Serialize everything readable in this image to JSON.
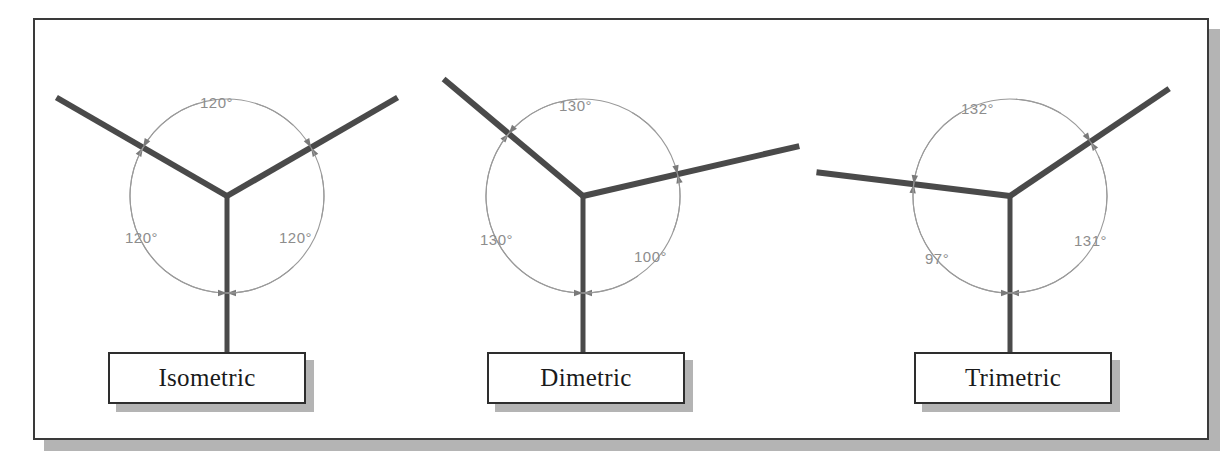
{
  "figure": {
    "frame": {
      "border_color": "#3a3a3a",
      "shadow_color": "#b4b4b4",
      "background": "#ffffff"
    },
    "style": {
      "axis_color": "#4a4a4a",
      "arc_color": "#9a9a9a",
      "arrow_color": "#7a7a7a",
      "label_text_color": "#1a1a1a",
      "angle_text_color": "#8d8d8d"
    }
  },
  "diagrams": [
    {
      "id": "isometric",
      "label": "Isometric",
      "origin": {
        "x": 227,
        "y": 196
      },
      "arc_radius": 97,
      "axes": [
        {
          "name": "left-axis",
          "angle_deg": 150,
          "length": 197
        },
        {
          "name": "right-axis",
          "angle_deg": 30,
          "length": 197
        },
        {
          "name": "vertical-axis",
          "angle_deg": 270,
          "length": 156
        }
      ],
      "angles": [
        {
          "name": "top-angle",
          "value": "120°",
          "x": 200,
          "y": 94,
          "between": "left-axis/right-axis"
        },
        {
          "name": "left-angle",
          "value": "120°",
          "x": 125,
          "y": 229,
          "between": "left-axis/vertical-axis"
        },
        {
          "name": "right-angle",
          "value": "120°",
          "x": 279,
          "y": 229,
          "between": "right-axis/vertical-axis"
        }
      ],
      "box": {
        "x": 108,
        "y": 352,
        "w": 198,
        "h": 52
      }
    },
    {
      "id": "dimetric",
      "label": "Dimetric",
      "origin": {
        "x": 583,
        "y": 196
      },
      "arc_radius": 97,
      "axes": [
        {
          "name": "left-axis",
          "angle_deg": 140,
          "length": 182
        },
        {
          "name": "right-axis",
          "angle_deg": 13,
          "length": 222
        },
        {
          "name": "vertical-axis",
          "angle_deg": 270,
          "length": 156
        }
      ],
      "angles": [
        {
          "name": "top-angle",
          "value": "130°",
          "x": 559,
          "y": 97,
          "between": "left-axis/right-axis"
        },
        {
          "name": "left-angle",
          "value": "130°",
          "x": 480,
          "y": 231,
          "between": "left-axis/vertical-axis"
        },
        {
          "name": "right-angle",
          "value": "100°",
          "x": 634,
          "y": 248,
          "between": "right-axis/vertical-axis"
        }
      ],
      "box": {
        "x": 487,
        "y": 352,
        "w": 198,
        "h": 52
      }
    },
    {
      "id": "trimetric",
      "label": "Trimetric",
      "origin": {
        "x": 1010,
        "y": 196
      },
      "arc_radius": 97,
      "axes": [
        {
          "name": "left-axis",
          "angle_deg": 173,
          "length": 195
        },
        {
          "name": "right-axis",
          "angle_deg": 34,
          "length": 192
        },
        {
          "name": "vertical-axis",
          "angle_deg": 270,
          "length": 156
        }
      ],
      "angles": [
        {
          "name": "top-angle",
          "value": "132°",
          "x": 961,
          "y": 100,
          "between": "left-axis/right-axis"
        },
        {
          "name": "left-angle",
          "value": "97°",
          "x": 925,
          "y": 250,
          "between": "left-axis/vertical-axis"
        },
        {
          "name": "right-angle",
          "value": "131°",
          "x": 1074,
          "y": 232,
          "between": "right-axis/vertical-axis"
        }
      ],
      "box": {
        "x": 914,
        "y": 352,
        "w": 198,
        "h": 52
      }
    }
  ]
}
